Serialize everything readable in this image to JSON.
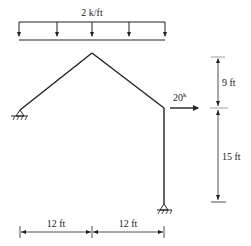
{
  "diagram": {
    "type": "structural-frame",
    "distributed_load": {
      "label": "2 k/ft",
      "arrow_count": 5
    },
    "point_load": {
      "label": "20",
      "superscript": "k",
      "direction": "right"
    },
    "vertical_dimensions": [
      {
        "label": "9 ft"
      },
      {
        "label": "15 ft"
      }
    ],
    "horizontal_dimensions": [
      {
        "label": "12 ft"
      },
      {
        "label": "12 ft"
      }
    ],
    "supports": [
      {
        "name": "left-pin-support",
        "type": "pin"
      },
      {
        "name": "right-pin-support",
        "type": "pin"
      }
    ],
    "colors": {
      "line": "#222222",
      "background": "#ffffff"
    }
  }
}
